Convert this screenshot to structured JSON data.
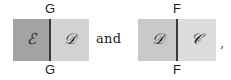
{
  "figure": {
    "caption_text": "and",
    "trailing_punctuation": ",",
    "groups": [
      {
        "id": "left-figure",
        "edge_label_top": "G",
        "edge_label_bottom": "G",
        "left_panel": {
          "symbol": "ℰ",
          "symbol_name": "script-capital-E",
          "fill_color": "#a3a3a3"
        },
        "right_panel": {
          "symbol": "𝒟",
          "symbol_name": "script-capital-D",
          "fill_color": "#d2d2d2"
        },
        "divider_color": "#3a3a3a"
      },
      {
        "id": "right-figure",
        "edge_label_top": "F",
        "edge_label_bottom": "F",
        "left_panel": {
          "symbol": "𝒟",
          "symbol_name": "script-capital-D",
          "fill_color": "#c9c9c9"
        },
        "right_panel": {
          "symbol": "𝒞",
          "symbol_name": "script-capital-C",
          "fill_color": "#dcdcdc"
        },
        "divider_color": "#3a3a3a"
      }
    ]
  },
  "colors": {
    "background": "#ffffff",
    "text": "#1d1d1d",
    "rule": "#3a3a3a"
  }
}
